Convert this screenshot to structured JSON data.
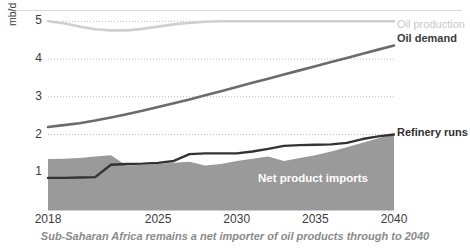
{
  "chart_data": {
    "type": "area",
    "title": "",
    "caption": "Sub-Saharan Africa remains a net importer of oil products through to 2040",
    "xlabel": "",
    "ylabel": "mb/d",
    "xlim": [
      2018,
      2040
    ],
    "ylim": [
      0,
      5.3
    ],
    "grid": true,
    "grid_style": "dotted-horizontal",
    "legend_position": "inline-right",
    "x": [
      2018,
      2019,
      2020,
      2021,
      2022,
      2023,
      2024,
      2025,
      2026,
      2027,
      2028,
      2029,
      2030,
      2031,
      2032,
      2033,
      2034,
      2035,
      2036,
      2037,
      2038,
      2039,
      2040
    ],
    "xticks": [
      "2018",
      "2025",
      "2030",
      "2035",
      "2040"
    ],
    "xtick_values": [
      2018,
      2025,
      2030,
      2035,
      2040
    ],
    "yticks": [
      "1",
      "2",
      "3",
      "4",
      "5"
    ],
    "ytick_values": [
      1,
      2,
      3,
      4,
      5
    ],
    "series": [
      {
        "name": "Oil production",
        "type": "line",
        "color": "#cfcfcf",
        "label_color": "#c8c8c8",
        "values": [
          5.0,
          4.95,
          4.86,
          4.79,
          4.76,
          4.76,
          4.8,
          4.86,
          4.92,
          4.96,
          4.99,
          5.0,
          5.0,
          5.0,
          5.0,
          5.0,
          5.0,
          5.0,
          5.0,
          5.0,
          5.0,
          5.0,
          5.0
        ]
      },
      {
        "name": "Oil demand",
        "type": "line",
        "color": "#6b6b6b",
        "label_color": "#3b3b3b",
        "values": [
          2.2,
          2.25,
          2.3,
          2.37,
          2.45,
          2.54,
          2.63,
          2.73,
          2.83,
          2.93,
          3.04,
          3.15,
          3.26,
          3.37,
          3.48,
          3.59,
          3.7,
          3.81,
          3.92,
          4.03,
          4.14,
          4.25,
          4.36
        ]
      },
      {
        "name": "Refinery runs",
        "type": "line",
        "color": "#333333",
        "label_color": "#2f2f2f",
        "values": [
          0.85,
          0.85,
          0.86,
          0.87,
          1.2,
          1.22,
          1.23,
          1.25,
          1.3,
          1.48,
          1.5,
          1.5,
          1.5,
          1.55,
          1.62,
          1.7,
          1.72,
          1.73,
          1.74,
          1.78,
          1.88,
          1.95,
          2.0
        ]
      },
      {
        "name": "Net product imports",
        "type": "area",
        "color": "#9a9a9a",
        "label_color": "#ffffff",
        "values": [
          1.35,
          1.36,
          1.38,
          1.42,
          1.45,
          1.18,
          1.2,
          1.22,
          1.25,
          1.28,
          1.18,
          1.22,
          1.3,
          1.36,
          1.42,
          1.3,
          1.38,
          1.45,
          1.55,
          1.66,
          1.78,
          1.9,
          2.0
        ]
      }
    ]
  },
  "labels": {
    "oil_production": "Oil production",
    "oil_demand": "Oil demand",
    "refinery_runs": "Refinery runs",
    "net_product_imports": "Net product imports"
  }
}
